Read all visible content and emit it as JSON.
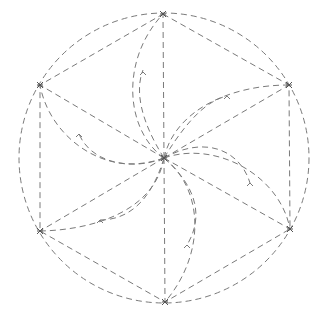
{
  "diagram": {
    "type": "geometric-pinwheel",
    "stroke_color": "#7a7a7a",
    "dash": "6 4",
    "circle": {
      "cx": 164,
      "cy": 158,
      "r": 145
    },
    "center": {
      "x": 164,
      "y": 158
    },
    "vertices": [
      {
        "name": "top",
        "x": 163,
        "y": 14
      },
      {
        "name": "upper-right",
        "x": 289,
        "y": 85
      },
      {
        "name": "lower-right",
        "x": 290,
        "y": 229
      },
      {
        "name": "bottom",
        "x": 165,
        "y": 302
      },
      {
        "name": "lower-left",
        "x": 40,
        "y": 231
      },
      {
        "name": "upper-left",
        "x": 40,
        "y": 85
      }
    ],
    "petals": [
      {
        "to": "top",
        "outer": "M164,158 C125,130 120,60 163,14",
        "inner": "M164,158 C140,120 135,90 143,70",
        "arrow": {
          "x": 143,
          "y": 72
        }
      },
      {
        "to": "upper-right",
        "outer": "M164,158 C175,110 230,85 289,85",
        "inner": "M164,158 C190,115 210,100 227,96",
        "arrow": {
          "x": 227,
          "y": 96
        }
      },
      {
        "to": "lower-right",
        "outer": "M164,158 C215,140 280,175 290,229",
        "inner": "M164,158 C205,135 240,150 250,183",
        "arrow": {
          "x": 250,
          "y": 183
        }
      },
      {
        "to": "bottom",
        "outer": "M164,158 C205,190 205,255 165,302",
        "inner": "M164,158 C195,185 205,215 187,245",
        "arrow": {
          "x": 187,
          "y": 245
        }
      },
      {
        "to": "lower-left",
        "outer": "M164,158 C155,210 95,230 40,231",
        "inner": "M164,158 C150,205 125,220 100,220",
        "arrow": {
          "x": 100,
          "y": 220
        }
      },
      {
        "to": "upper-left",
        "outer": "M164,158 C110,180 50,140 40,85",
        "inner": "M164,158 C125,172 90,160 79,134",
        "arrow": {
          "x": 79,
          "y": 134
        }
      }
    ]
  }
}
